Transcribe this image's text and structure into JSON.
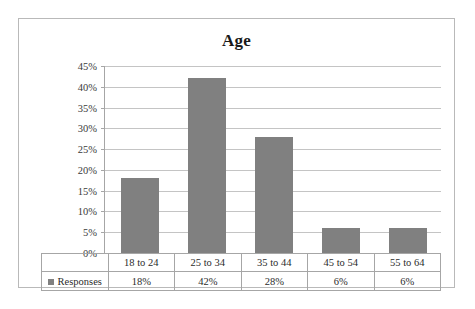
{
  "chart_data": {
    "type": "bar",
    "title": "Age",
    "xlabel": "",
    "ylabel": "",
    "categories": [
      "18 to 24",
      "25 to 34",
      "35 to 44",
      "45 to 54",
      "55 to 64"
    ],
    "values": [
      18,
      42,
      28,
      6,
      6
    ],
    "value_labels": [
      "18%",
      "42%",
      "28%",
      "6%",
      "6%"
    ],
    "series": [
      {
        "name": "Responses",
        "values": [
          18,
          42,
          28,
          6,
          6
        ],
        "color": "#808080"
      }
    ],
    "ylim": [
      0,
      45
    ],
    "ytick_values": [
      45,
      40,
      35,
      30,
      25,
      20,
      15,
      10,
      5,
      0
    ],
    "ytick_labels": [
      "45%",
      "40%",
      "35%",
      "30%",
      "25%",
      "20%",
      "15%",
      "10%",
      "5%",
      "0%"
    ],
    "grid": true,
    "legend_position": "data-table-row",
    "bar_color": "#808080",
    "gridline_color": "#c4c4c4",
    "axis_color": "#a6a6a6",
    "border_color": "#b9b9b9",
    "background": "#ffffff"
  },
  "table": {
    "legend_label": "Responses",
    "header_row": [
      "18 to 24",
      "25 to 34",
      "35 to 44",
      "45 to 54",
      "55 to 64"
    ],
    "value_row": [
      "18%",
      "42%",
      "28%",
      "6%",
      "6%"
    ]
  }
}
